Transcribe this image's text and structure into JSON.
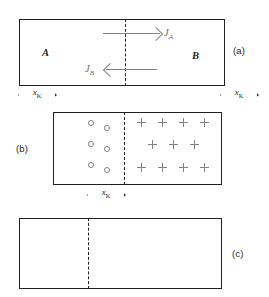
{
  "figure": {
    "width": 269,
    "height": 297,
    "background": "#ffffff",
    "ink_color": "#231f20",
    "marker_color": "#808285"
  },
  "panels": [
    {
      "id": "a",
      "label": "(a)",
      "label_side": "right",
      "regions": [
        {
          "name": "A",
          "label": "A"
        },
        {
          "name": "B",
          "label": "B"
        }
      ],
      "interface": "dashed",
      "fluxes": [
        {
          "name": "J_A",
          "label": "J",
          "sub": "A",
          "direction": "right"
        },
        {
          "name": "J_B",
          "label": "J",
          "sub": "B",
          "direction": "left"
        }
      ],
      "dimensions": [
        {
          "name": "x_K_left",
          "label": "x",
          "sub": "K"
        },
        {
          "name": "x_K_right",
          "label": "x",
          "sub": "K"
        }
      ]
    },
    {
      "id": "b",
      "label": "(b)",
      "label_side": "left",
      "interface": "dashed",
      "vacancies": {
        "symbol": "circle",
        "count": 6,
        "rows": [
          2,
          2,
          2
        ]
      },
      "markers": {
        "symbol": "plus",
        "count": 11,
        "rows": [
          4,
          3,
          4
        ]
      },
      "dimensions": [
        {
          "name": "x_K",
          "label": "x",
          "sub": "K"
        }
      ]
    },
    {
      "id": "c",
      "label": "(c)",
      "label_side": "right",
      "interface": "dashed",
      "regions": [],
      "fluxes": [],
      "dimensions": []
    }
  ],
  "glyphs": {
    "vacancy_icon": "open-circle",
    "marker_icon": "plus-sign",
    "arrow_right_icon": "arrow-right",
    "arrow_left_icon": "arrow-left",
    "dimension_icon": "dimension-arrow"
  }
}
